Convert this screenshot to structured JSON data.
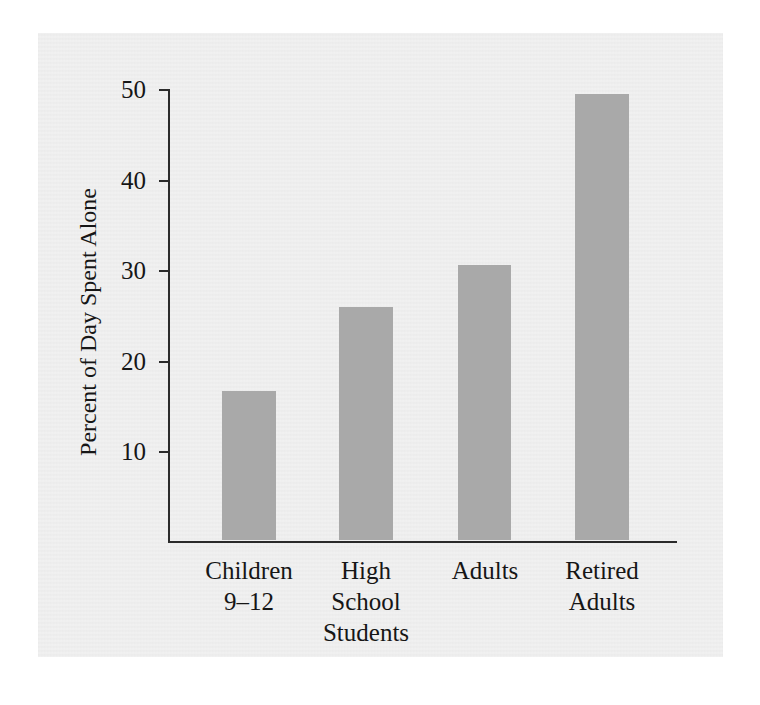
{
  "chart_data": {
    "type": "bar",
    "title": "",
    "subtitle": "",
    "xlabel": "",
    "ylabel": "Percent of Day Spent Alone",
    "categories": [
      "Children\n9–12",
      "High\nSchool\nStudents",
      "Adults",
      "Retired\nAdults"
    ],
    "category_names": [
      "Children 9–12",
      "High School Students",
      "Adults",
      "Retired Adults"
    ],
    "values": [
      16.5,
      25.7,
      30.3,
      49.2
    ],
    "ylim": [
      0,
      50
    ],
    "yticks": [
      10,
      20,
      30,
      40,
      50
    ],
    "ytick_labels": [
      "10",
      "20",
      "30",
      "40",
      "50"
    ],
    "grid": false,
    "legend": null,
    "bar_color": "#a9a9a9",
    "axis_color": "#2b2b2b",
    "background_color": "#ececec",
    "annotations": []
  }
}
